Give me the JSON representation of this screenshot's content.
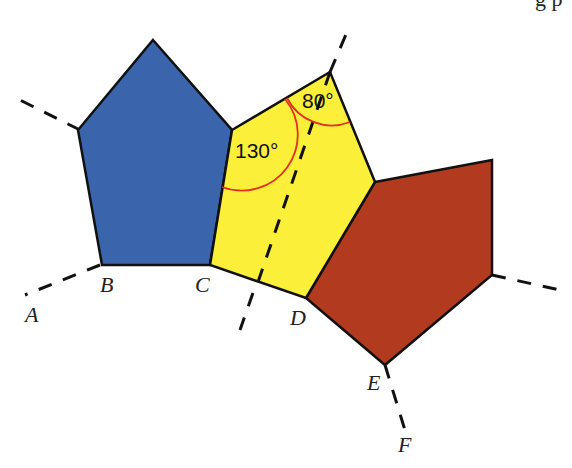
{
  "figure": {
    "title_fragment": "g p",
    "colors": {
      "blue": "#3a65ad",
      "yellow": "#fbef3a",
      "red": "#b23a1e",
      "arc": "#e0301e",
      "edge": "#111111"
    },
    "points": {
      "A": "A",
      "B": "B",
      "C": "C",
      "D": "D",
      "E": "E",
      "F": "F"
    },
    "angles": {
      "yellow_left": "130°",
      "yellow_top": "80°"
    },
    "shapes": [
      {
        "name": "blue-pentagon",
        "color": "blue"
      },
      {
        "name": "yellow-pentagon",
        "color": "yellow"
      },
      {
        "name": "red-pentagon",
        "color": "red"
      }
    ]
  }
}
